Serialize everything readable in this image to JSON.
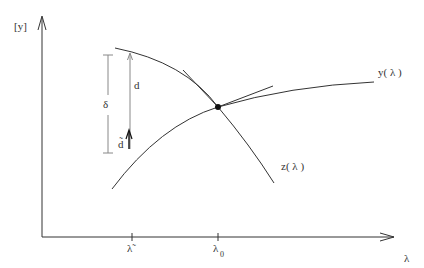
{
  "diagram": {
    "axes": {
      "y_label": "[y]",
      "x_label": "λ",
      "x_ticks": [
        {
          "label": "λ̃",
          "x": 132
        },
        {
          "label": "λ",
          "sub": "0",
          "x": 218
        }
      ]
    },
    "curves": {
      "y": {
        "label": "y( λ )"
      },
      "z": {
        "label": "z( λ )"
      }
    },
    "annotations": {
      "delta": "δ",
      "d": "d",
      "d_tilde": "d̃"
    },
    "colors": {
      "stroke": "#333333",
      "light_stroke": "#888888",
      "background": "#ffffff"
    }
  }
}
